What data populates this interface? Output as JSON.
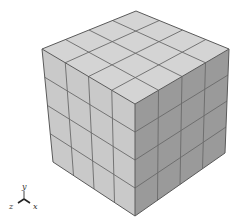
{
  "figure": {
    "divisions": 4,
    "colors": {
      "top_face": "#d4d4d4",
      "left_face": "#c9c9c9",
      "right_face": "#9a9a9a",
      "grid_line": "#6a6a6a",
      "edge_line": "#5a5a5a"
    },
    "vertices": {
      "top_back": [
        136,
        11
      ],
      "left_top": [
        42,
        49
      ],
      "front_top": [
        135,
        104
      ],
      "right_top": [
        229,
        49
      ],
      "left_bottom": [
        53,
        162
      ],
      "front_bottom": [
        135,
        216
      ],
      "right_bottom": [
        225,
        153
      ]
    }
  },
  "axis_triad": {
    "origin": [
      24,
      199
    ],
    "labels": {
      "y": "y",
      "x": "x",
      "z": "z"
    }
  }
}
